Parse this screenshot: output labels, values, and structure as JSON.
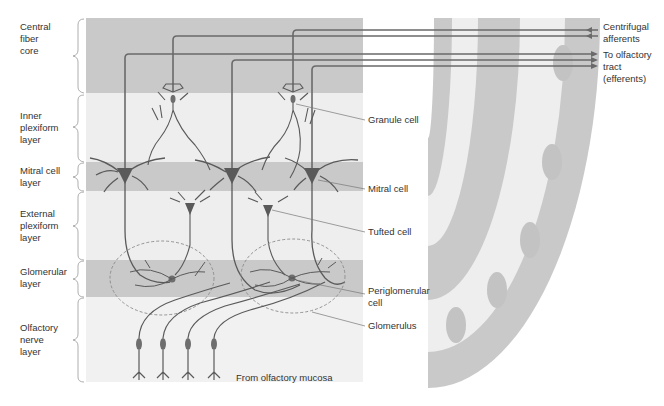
{
  "figure": {
    "layers": [
      {
        "id": "central-fiber-core",
        "label": "Central\nfiber\ncore",
        "y_top": 18,
        "y_bottom": 93,
        "shade": "#c9c9c9"
      },
      {
        "id": "inner-plexiform",
        "label": "Inner\nplexiform\nlayer",
        "y_top": 93,
        "y_bottom": 162,
        "shade": "#eeeeee"
      },
      {
        "id": "mitral-cell",
        "label": "Mitral cell\nlayer",
        "y_top": 162,
        "y_bottom": 191,
        "shade": "#c9c9c9"
      },
      {
        "id": "external-plexiform",
        "label": "External\nplexiform\nlayer",
        "y_top": 191,
        "y_bottom": 260,
        "shade": "#eeeeee"
      },
      {
        "id": "glomerular",
        "label": "Glomerular\nlayer",
        "y_top": 260,
        "y_bottom": 297,
        "shade": "#c9c9c9"
      },
      {
        "id": "olfactory-nerve",
        "label": "Olfactory\nnerve\nlayer",
        "y_top": 297,
        "y_bottom": 382,
        "shade": "#f1f1f1"
      }
    ],
    "cell_labels": [
      {
        "id": "granule-cell",
        "text": "Granule cell"
      },
      {
        "id": "mitral-cell",
        "text": "Mitral cell"
      },
      {
        "id": "tufted-cell",
        "text": "Tufted cell"
      },
      {
        "id": "periglomerular-cell",
        "text": "Periglomerular\ncell"
      },
      {
        "id": "glomerulus",
        "text": "Glomerulus"
      }
    ],
    "pathway_labels": [
      {
        "id": "centrifugal-afferents",
        "text": "Centrifugal\nafferents",
        "direction": "in"
      },
      {
        "id": "to-olfactory-tract",
        "text": "To olfactory\ntract\n(efferents)",
        "direction": "out"
      }
    ],
    "source_label": "From olfactory mucosa",
    "caption": "Figure (caption cropped at bottom edge)"
  },
  "colors": {
    "band_dark": "#c9c9c9",
    "band_light": "#eeeeee",
    "neuron": "#5a5a5a",
    "soma": "#6e6e6e",
    "leader_line": "#777777",
    "glomerulus_outline": "#8a8a8a"
  }
}
